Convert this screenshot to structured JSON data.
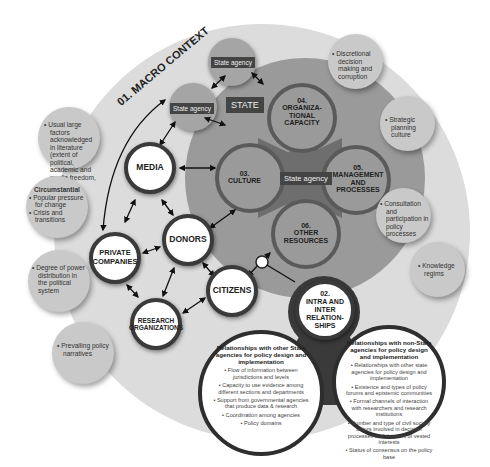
{
  "diagram": {
    "macro_context": {
      "label": "01. MACRO CONTEXT"
    },
    "state": {
      "label": "STATE",
      "agencies": [
        "State agency",
        "State agency"
      ],
      "core_label": "State agency",
      "capacities": [
        {
          "id": "03",
          "lines": [
            "03.",
            "CULTURE"
          ]
        },
        {
          "id": "04",
          "lines": [
            "04.",
            "ORGANIZA-",
            "TIONAL",
            "CAPACITY"
          ]
        },
        {
          "id": "05",
          "lines": [
            "05.",
            "MANAGEMENT",
            "AND",
            "PROCESSES"
          ]
        },
        {
          "id": "06",
          "lines": [
            "06.",
            "OTHER",
            "RESOURCES"
          ]
        }
      ]
    },
    "actors": {
      "media": "MEDIA",
      "donors": "DONORS",
      "private_companies_1": "PRIVATE",
      "private_companies_2": "COMPANIES",
      "citizens": "CITIZENS",
      "research_1": "RESEARCH",
      "research_2": "ORGANIZATIONS"
    },
    "relationships": {
      "lines": [
        "02.",
        "INTRA AND",
        "INTER",
        "RELATION-",
        "SHIPS"
      ],
      "state_box": {
        "title": "Relationships with other State agencies for policy design and implementation",
        "items": [
          "• Flow of information between jurisdictions and levels",
          "• Capacity to use evidence among different sections and departments",
          "• Support from governmental agencies that produce data & research",
          "• Coordination among agencies",
          "• Policy domains"
        ]
      },
      "nonstate_box": {
        "title": "Relationships with non-State agencies for policy design and implementation",
        "items": [
          "• Relationships with other state agencies for policy design and implementation",
          "• Existence and types of policy forums and epistemic communities",
          "• Formal channels of interaction with researchers and research institutions",
          "• Number and type of civil society actors involved in decision processes and degrees of vested interests",
          "• Status of consensus on the policy base"
        ]
      }
    },
    "left_factors": {
      "large_factors": "• Usual large factors acknowledged in literature (extent of political, academic and media freedom, etc.)",
      "circumstantial_title": "Circumstantial",
      "circumstantial_items": [
        "• Popular pressure for change",
        "• Crisis and transitions"
      ],
      "power": "• Degree of power distribution in the political system",
      "narratives": "• Prevailing policy narratives"
    },
    "right_factors": {
      "discretional": "• Discretional decision making and corruption",
      "strategic": "• Strategic planning culture",
      "consultation": "• Consultation and participation in policy processes",
      "knowledge": "• Knowledge regims"
    },
    "colors": {
      "macro_bg": "#dcdcdc",
      "state_bg": "#9a9a9a",
      "capacity_ring": "#5a5a5a",
      "side_circle": "#c9c9c9",
      "label_box": "#444444"
    }
  }
}
